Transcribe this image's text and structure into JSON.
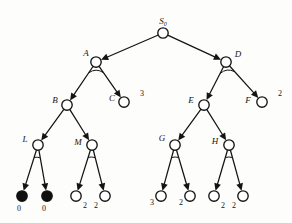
{
  "diagram": {
    "type": "and-or-tree",
    "colors": {
      "stroke": "#141414",
      "node_fill_open": "#ffffff",
      "node_fill_solved": "#101010",
      "background": "#fdfdfc"
    },
    "nodes": [
      {
        "id": "S0",
        "label": "S",
        "sublabel": "0",
        "x": 163,
        "y": 33,
        "r": 5.2,
        "kind": "or",
        "filled": false,
        "label_dx": 0,
        "label_dy": -9,
        "label_anchor": "middle",
        "arc": false
      },
      {
        "id": "A",
        "label": "A",
        "sublabel": "",
        "x": 96,
        "y": 62,
        "r": 5.2,
        "kind": "and",
        "filled": false,
        "label_dx": -10,
        "label_dy": -6,
        "label_anchor": "middle",
        "arc": true
      },
      {
        "id": "D",
        "label": "D",
        "sublabel": "",
        "x": 226,
        "y": 62,
        "r": 5.2,
        "kind": "and",
        "filled": false,
        "label_dx": 12,
        "label_dy": -5,
        "label_anchor": "middle",
        "arc": true
      },
      {
        "id": "B",
        "label": "B",
        "sublabel": "",
        "x": 67,
        "y": 105,
        "r": 5.2,
        "kind": "or",
        "filled": false,
        "label_dx": -12,
        "label_dy": -2,
        "label_anchor": "middle",
        "arc": false
      },
      {
        "id": "C",
        "label": "C",
        "sublabel": "",
        "x": 124,
        "y": 102,
        "r": 5.2,
        "kind": "leaf",
        "filled": false,
        "label_dx": -12,
        "label_dy": -1,
        "label_anchor": "middle",
        "arc": false
      },
      {
        "id": "E",
        "label": "E",
        "sublabel": "",
        "x": 204,
        "y": 105,
        "r": 5.2,
        "kind": "or",
        "filled": false,
        "label_dx": -13,
        "label_dy": -2,
        "label_anchor": "middle",
        "arc": false
      },
      {
        "id": "F",
        "label": "F",
        "sublabel": "",
        "x": 262,
        "y": 102,
        "r": 5.2,
        "kind": "leaf",
        "filled": false,
        "label_dx": -14,
        "label_dy": 1,
        "label_anchor": "middle",
        "arc": false
      },
      {
        "id": "L",
        "label": "L",
        "sublabel": "",
        "x": 38,
        "y": 145,
        "r": 5.2,
        "kind": "and",
        "filled": false,
        "label_dx": -13,
        "label_dy": -3,
        "label_anchor": "middle",
        "arc": true
      },
      {
        "id": "M",
        "label": "M",
        "sublabel": "",
        "x": 92,
        "y": 145,
        "r": 5.2,
        "kind": "and",
        "filled": false,
        "label_dx": -14,
        "label_dy": 0,
        "label_anchor": "middle",
        "arc": true
      },
      {
        "id": "G",
        "label": "G",
        "sublabel": "",
        "x": 175,
        "y": 145,
        "r": 5.2,
        "kind": "and",
        "filled": false,
        "label_dx": -13,
        "label_dy": -4,
        "label_anchor": "middle",
        "arc": true
      },
      {
        "id": "H",
        "label": "H",
        "sublabel": "",
        "x": 229,
        "y": 145,
        "r": 5.2,
        "kind": "and",
        "filled": false,
        "label_dx": -14,
        "label_dy": -1,
        "label_anchor": "middle",
        "arc": true
      },
      {
        "id": "L1",
        "label": "",
        "sublabel": "",
        "x": 22,
        "y": 196,
        "r": 5.2,
        "kind": "leaf",
        "filled": true,
        "label_dx": 0,
        "label_dy": 0,
        "label_anchor": "middle",
        "arc": false
      },
      {
        "id": "L2",
        "label": "",
        "sublabel": "",
        "x": 47,
        "y": 196,
        "r": 5.2,
        "kind": "leaf",
        "filled": true,
        "label_dx": 0,
        "label_dy": 0,
        "label_anchor": "middle",
        "arc": false
      },
      {
        "id": "M1",
        "label": "",
        "sublabel": "",
        "x": 76,
        "y": 196,
        "r": 5.2,
        "kind": "leaf",
        "filled": false,
        "label_dx": 0,
        "label_dy": 0,
        "label_anchor": "middle",
        "arc": false
      },
      {
        "id": "M2",
        "label": "",
        "sublabel": "",
        "x": 105,
        "y": 196,
        "r": 5.2,
        "kind": "leaf",
        "filled": false,
        "label_dx": 0,
        "label_dy": 0,
        "label_anchor": "middle",
        "arc": false
      },
      {
        "id": "G1",
        "label": "",
        "sublabel": "",
        "x": 161,
        "y": 196,
        "r": 5.2,
        "kind": "leaf",
        "filled": false,
        "label_dx": 0,
        "label_dy": 0,
        "label_anchor": "middle",
        "arc": false
      },
      {
        "id": "G2",
        "label": "",
        "sublabel": "",
        "x": 190,
        "y": 196,
        "r": 5.2,
        "kind": "leaf",
        "filled": false,
        "label_dx": 0,
        "label_dy": 0,
        "label_anchor": "middle",
        "arc": false
      },
      {
        "id": "H1",
        "label": "",
        "sublabel": "",
        "x": 214,
        "y": 196,
        "r": 5.2,
        "kind": "leaf",
        "filled": false,
        "label_dx": 0,
        "label_dy": 0,
        "label_anchor": "middle",
        "arc": false
      },
      {
        "id": "H2",
        "label": "",
        "sublabel": "",
        "x": 243,
        "y": 196,
        "r": 5.2,
        "kind": "leaf",
        "filled": false,
        "label_dx": 0,
        "label_dy": 0,
        "label_anchor": "middle",
        "arc": false
      }
    ],
    "edges": [
      {
        "from": "S0",
        "to": "A",
        "arrow": true
      },
      {
        "from": "S0",
        "to": "D",
        "arrow": true
      },
      {
        "from": "A",
        "to": "B",
        "arrow": true
      },
      {
        "from": "A",
        "to": "C",
        "arrow": true
      },
      {
        "from": "D",
        "to": "E",
        "arrow": true
      },
      {
        "from": "D",
        "to": "F",
        "arrow": true
      },
      {
        "from": "B",
        "to": "L",
        "arrow": true
      },
      {
        "from": "B",
        "to": "M",
        "arrow": true
      },
      {
        "from": "E",
        "to": "G",
        "arrow": true
      },
      {
        "from": "E",
        "to": "H",
        "arrow": true
      },
      {
        "from": "L",
        "to": "L1",
        "arrow": true
      },
      {
        "from": "L",
        "to": "L2",
        "arrow": true
      },
      {
        "from": "M",
        "to": "M1",
        "arrow": true
      },
      {
        "from": "M",
        "to": "M2",
        "arrow": true
      },
      {
        "from": "G",
        "to": "G1",
        "arrow": true
      },
      {
        "from": "G",
        "to": "G2",
        "arrow": true
      },
      {
        "from": "H",
        "to": "H1",
        "arrow": true
      },
      {
        "from": "H",
        "to": "H2",
        "arrow": true
      }
    ],
    "values": [
      {
        "node": "C",
        "text": "3",
        "x": 142,
        "y": 96
      },
      {
        "node": "F",
        "text": "2",
        "x": 280,
        "y": 96
      },
      {
        "node": "L1",
        "text": "0",
        "x": 19,
        "y": 211
      },
      {
        "node": "L2",
        "text": "0",
        "x": 44,
        "y": 211
      },
      {
        "node": "M1",
        "text": "2",
        "x": 85,
        "y": 208
      },
      {
        "node": "M2",
        "text": "2",
        "x": 96,
        "y": 208
      },
      {
        "node": "G1",
        "text": "3",
        "x": 152,
        "y": 205
      },
      {
        "node": "G2",
        "text": "2",
        "x": 181,
        "y": 205
      },
      {
        "node": "H1",
        "text": "2",
        "x": 223,
        "y": 208
      },
      {
        "node": "H2",
        "text": "2",
        "x": 234,
        "y": 208
      }
    ]
  }
}
